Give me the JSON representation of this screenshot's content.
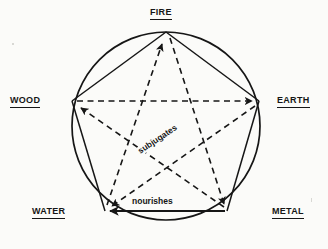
{
  "diagram": {
    "type": "cycle-diagram",
    "background_color": "#fbfbf9",
    "stroke_color": "#161616",
    "circle": {
      "cx": 166,
      "cy": 126,
      "r": 94
    },
    "nodes": [
      {
        "id": "fire",
        "label": "FIRE",
        "x": 166,
        "y": 32,
        "label_position": "top"
      },
      {
        "id": "earth",
        "label": "EARTH",
        "x": 259,
        "y": 101,
        "label_position": "right"
      },
      {
        "id": "metal",
        "label": "METAL",
        "x": 227,
        "y": 211,
        "label_position": "bottom-right"
      },
      {
        "id": "water",
        "label": "WATER",
        "x": 105,
        "y": 211,
        "label_position": "bottom-left"
      },
      {
        "id": "wood",
        "label": "WOOD",
        "x": 72,
        "y": 101,
        "label_position": "left"
      }
    ],
    "relations": [
      {
        "name": "nourishes",
        "label": "nourishes",
        "style": "solid",
        "description": "generating cycle along the pentagon edges",
        "edges": [
          {
            "from": "wood",
            "to": "fire",
            "arrow": false
          },
          {
            "from": "fire",
            "to": "earth",
            "arrow": false
          },
          {
            "from": "earth",
            "to": "metal",
            "arrow": false
          },
          {
            "from": "metal",
            "to": "water",
            "arrow": true
          },
          {
            "from": "water",
            "to": "wood",
            "arrow": false
          }
        ]
      },
      {
        "name": "subjugates",
        "label": "subjugates",
        "style": "dashed",
        "description": "overcoming cycle along the inner pentagram",
        "edges": [
          {
            "from": "wood",
            "to": "earth",
            "arrow": true
          },
          {
            "from": "earth",
            "to": "water",
            "arrow": true
          },
          {
            "from": "water",
            "to": "fire",
            "arrow": true
          },
          {
            "from": "fire",
            "to": "metal",
            "arrow": true
          },
          {
            "from": "metal",
            "to": "wood",
            "arrow": true
          }
        ]
      }
    ]
  }
}
